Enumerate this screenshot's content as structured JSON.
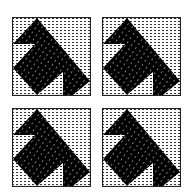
{
  "figure": {
    "colors": {
      "background": "#ffffff",
      "border": "#222222",
      "shape_fill": "#000000",
      "dot_pattern": "#333333",
      "shape_speckle": "#cccccc"
    },
    "panels": [
      {
        "id": "top-left",
        "x": 12,
        "y": 17
      },
      {
        "id": "top-right",
        "x": 102,
        "y": 17
      },
      {
        "id": "bottom-left",
        "x": 12,
        "y": 108
      },
      {
        "id": "bottom-right",
        "x": 102,
        "y": 108
      }
    ],
    "shape_points": "25,1 1,27 23,27 1,51 25,78 51,55 51,78 61,78 78,64"
  }
}
